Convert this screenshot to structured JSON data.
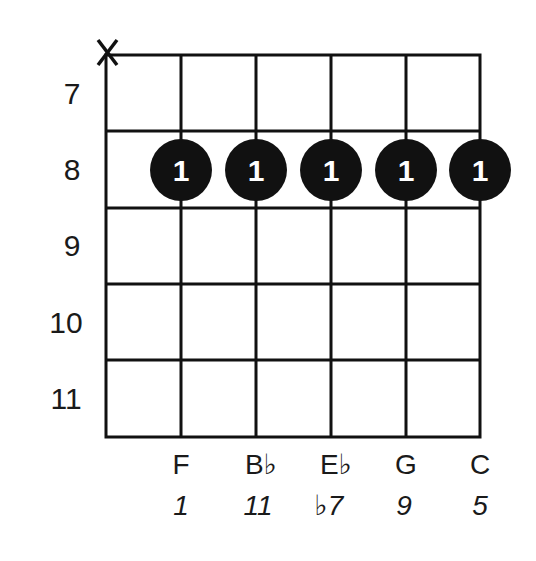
{
  "chord_diagram": {
    "open_muted": [
      {
        "string": 1,
        "symbol": "X"
      }
    ],
    "fret_numbers": [
      "7",
      "8",
      "9",
      "10",
      "11"
    ],
    "strings": 6,
    "frets_shown": 5,
    "dots": [
      {
        "string": 2,
        "fret": "8",
        "finger": "1"
      },
      {
        "string": 3,
        "fret": "8",
        "finger": "1"
      },
      {
        "string": 4,
        "fret": "8",
        "finger": "1"
      },
      {
        "string": 5,
        "fret": "8",
        "finger": "1"
      },
      {
        "string": 6,
        "fret": "8",
        "finger": "1"
      }
    ],
    "notes": [
      "F",
      "B♭",
      "E♭",
      "G",
      "C"
    ],
    "intervals": [
      "1",
      "11",
      "♭7",
      "9",
      "5"
    ],
    "colors": {
      "ink": "#111111",
      "background": "#ffffff",
      "dot": "#111111",
      "finger_text": "#ffffff"
    }
  }
}
